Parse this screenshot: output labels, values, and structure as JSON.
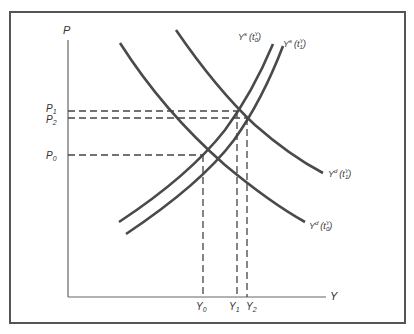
{
  "axes": {
    "y_label": "P",
    "x_label": "Y"
  },
  "price_ticks": [
    {
      "main": "P",
      "sub": "1"
    },
    {
      "main": "P",
      "sub": "2"
    },
    {
      "main": "P",
      "sub": "0"
    }
  ],
  "output_ticks": [
    {
      "main": "Y",
      "sub": "0"
    },
    {
      "main": "Y",
      "sub": "1"
    },
    {
      "main": "Y",
      "sub": "2"
    }
  ],
  "curves": {
    "supply_0": {
      "main": "Y",
      "sup": "s",
      "arg": "(t",
      "arg_sup": "Y",
      "arg_sub": "0",
      "close": ")"
    },
    "supply_1": {
      "main": "Y",
      "sup": "s",
      "arg": "(t",
      "arg_sup": "Y",
      "arg_sub": "1",
      "close": ")"
    },
    "demand_1": {
      "main": "Y",
      "sup": "d",
      "arg": "(t",
      "arg_sup": "Y",
      "arg_sub": "1",
      "close": ")"
    },
    "demand_0": {
      "main": "Y",
      "sup": "d",
      "arg": "(t",
      "arg_sup": "Y",
      "arg_sub": "0",
      "close": ")"
    }
  },
  "colors": {
    "curve": "#4a4a4a",
    "frame": "#555555",
    "axis": "#666666"
  }
}
